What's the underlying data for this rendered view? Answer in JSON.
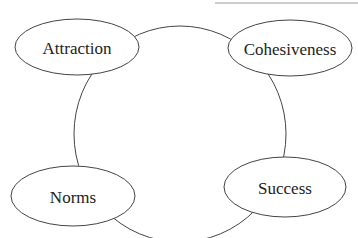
{
  "diagram": {
    "title": "",
    "colors": {
      "stroke": "#444444",
      "top_rule": "#9a9a9a",
      "text": "#222222",
      "background": "#ffffff"
    },
    "cycle": {
      "cx": 180,
      "cy": 134,
      "rx": 106,
      "ry": 108
    },
    "top_rule": {
      "x1": 215,
      "x2": 358,
      "y": 3
    },
    "nodes": [
      {
        "id": "attraction",
        "label": "Attraction",
        "cx": 77,
        "cy": 47,
        "rx": 62,
        "ry": 28
      },
      {
        "id": "cohesiveness",
        "label": "Cohesiveness",
        "cx": 290,
        "cy": 48,
        "rx": 62,
        "ry": 28
      },
      {
        "id": "success",
        "label": "Success",
        "cx": 285,
        "cy": 187,
        "rx": 61,
        "ry": 30
      },
      {
        "id": "norms",
        "label": "Norms",
        "cx": 73,
        "cy": 196,
        "rx": 62,
        "ry": 30
      }
    ]
  }
}
